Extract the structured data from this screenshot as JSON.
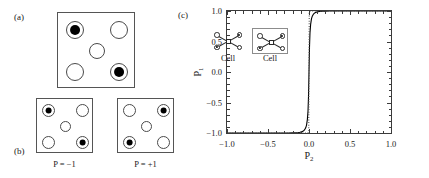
{
  "figure": {
    "panels": [
      {
        "id": "a",
        "label": "(a)"
      },
      {
        "id": "b",
        "label": "(b)"
      },
      {
        "id": "c",
        "label": "(c)"
      }
    ]
  },
  "panel_a": {
    "label": "(a)",
    "description": "five-dot quantum-dot cell, large",
    "dots": [
      {
        "position": "top-left",
        "state": "filled"
      },
      {
        "position": "top-right",
        "state": "open"
      },
      {
        "position": "center",
        "state": "open"
      },
      {
        "position": "bottom-left",
        "state": "open"
      },
      {
        "position": "bottom-right",
        "state": "filled"
      }
    ]
  },
  "panel_b": {
    "label": "(b)",
    "cells": [
      {
        "caption": "P = −1",
        "polarization": -1,
        "dots": [
          {
            "position": "top-left",
            "state": "filled"
          },
          {
            "position": "top-right",
            "state": "open"
          },
          {
            "position": "center",
            "state": "open"
          },
          {
            "position": "bottom-left",
            "state": "open"
          },
          {
            "position": "bottom-right",
            "state": "filled"
          }
        ]
      },
      {
        "caption": "P = +1",
        "polarization": 1,
        "dots": [
          {
            "position": "top-left",
            "state": "open"
          },
          {
            "position": "top-right",
            "state": "filled"
          },
          {
            "position": "center",
            "state": "open"
          },
          {
            "position": "bottom-left",
            "state": "filled"
          },
          {
            "position": "bottom-right",
            "state": "open"
          }
        ]
      }
    ]
  },
  "panel_c": {
    "label": "(c)",
    "inset": {
      "cells": [
        {
          "label": "Cell",
          "boxed": false,
          "dots": [
            {
              "position": "top-left",
              "state": "open"
            },
            {
              "position": "top-right",
              "state": "filled"
            },
            {
              "position": "bottom-left",
              "state": "filled"
            },
            {
              "position": "bottom-right",
              "state": "open"
            }
          ]
        },
        {
          "label": "Cell",
          "boxed": true,
          "dots": [
            {
              "position": "top-left",
              "state": "open"
            },
            {
              "position": "top-right",
              "state": "filled"
            },
            {
              "position": "bottom-left",
              "state": "filled"
            },
            {
              "position": "bottom-right",
              "state": "open"
            }
          ]
        }
      ]
    }
  },
  "chart_data": {
    "type": "line",
    "title": "",
    "xlabel": "P₂",
    "ylabel": "P₁",
    "xlim": [
      -1.0,
      1.0
    ],
    "ylim": [
      -1.0,
      1.0
    ],
    "xticks": [
      -1.0,
      -0.5,
      0.0,
      0.5,
      1.0
    ],
    "xticklabels": [
      "−1.0",
      "−0.5",
      "0.0",
      "0.5",
      "1.0"
    ],
    "yticks": [
      -1.0,
      -0.5,
      0.0,
      0.5,
      1.0
    ],
    "yticklabels": [
      "−1.0",
      "−0.5",
      "0.0",
      "0.5",
      "1.0"
    ],
    "grid": false,
    "legend": "none",
    "series": [
      {
        "name": "cell-cell response (solid)",
        "style": "solid",
        "color": "#000000",
        "x": [
          -1.0,
          -0.95,
          -0.9,
          -0.85,
          -0.8,
          -0.75,
          -0.7,
          -0.65,
          -0.6,
          -0.55,
          -0.5,
          -0.45,
          -0.4,
          -0.35,
          -0.3,
          -0.25,
          -0.2,
          -0.16,
          -0.13,
          -0.11,
          -0.09,
          -0.07,
          -0.055,
          -0.04,
          -0.03,
          -0.02,
          -0.012,
          -0.006,
          0.0,
          0.006,
          0.012,
          0.02,
          0.03,
          0.04,
          0.055,
          0.07,
          0.09,
          0.11,
          0.13,
          0.16,
          0.2,
          0.25,
          0.3,
          0.4,
          0.5,
          0.6,
          0.7,
          0.8,
          0.9,
          1.0
        ],
        "y": [
          -1.0,
          -1.0,
          -1.0,
          -1.0,
          -1.0,
          -1.0,
          -1.0,
          -1.0,
          -1.0,
          -1.0,
          -1.0,
          -1.0,
          -1.0,
          -0.999,
          -0.999,
          -0.999,
          -0.998,
          -0.996,
          -0.993,
          -0.989,
          -0.982,
          -0.968,
          -0.95,
          -0.915,
          -0.87,
          -0.78,
          -0.64,
          -0.4,
          0.0,
          0.4,
          0.64,
          0.78,
          0.87,
          0.915,
          0.95,
          0.968,
          0.982,
          0.989,
          0.993,
          0.996,
          0.998,
          0.999,
          0.999,
          1.0,
          1.0,
          1.0,
          1.0,
          1.0,
          1.0,
          1.0
        ]
      },
      {
        "name": "ideal abrupt response (dotted)",
        "style": "dotted",
        "color": "#555555",
        "x": [
          -1.0,
          -0.6,
          -0.3,
          -0.12,
          -0.05,
          -0.02,
          -0.008,
          -0.003,
          0.0,
          0.003,
          0.008,
          0.02,
          0.05,
          0.12,
          0.3,
          0.6,
          1.0
        ],
        "y": [
          -1.0,
          -1.0,
          -1.0,
          -1.0,
          -1.0,
          -0.999,
          -0.995,
          -0.96,
          0.0,
          0.96,
          0.995,
          0.999,
          1.0,
          1.0,
          1.0,
          1.0,
          1.0
        ]
      }
    ]
  }
}
